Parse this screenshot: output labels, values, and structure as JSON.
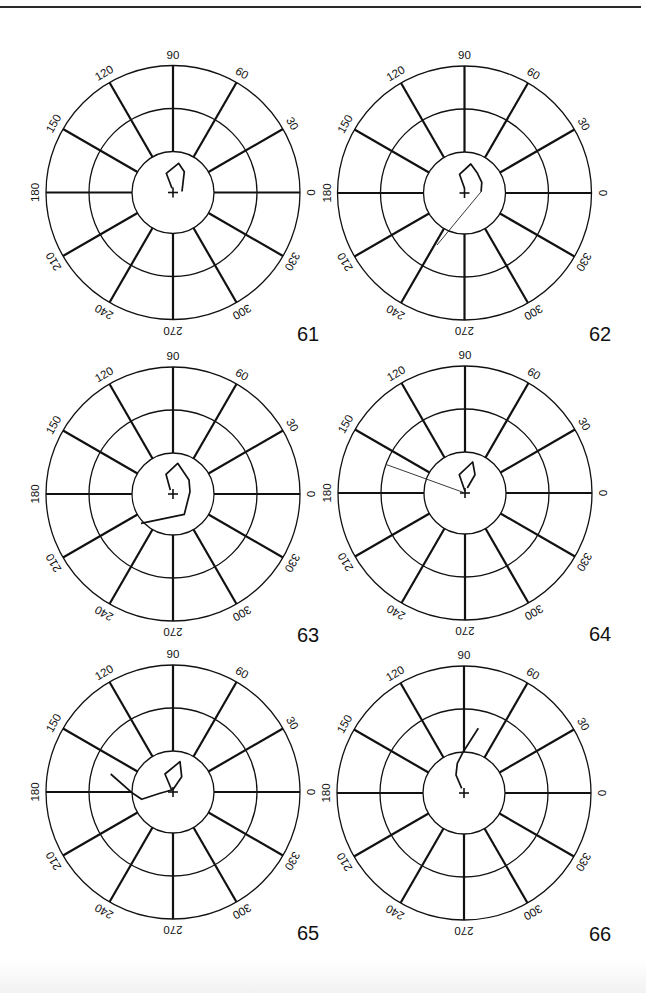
{
  "page": {
    "figure_count": 6,
    "plot_numbers": [
      "61",
      "62",
      "63",
      "64",
      "65",
      "66"
    ]
  },
  "chart_data": [
    {
      "type": "polar-hodograph",
      "id": "61",
      "label": "61",
      "angle_ticks": [
        0,
        30,
        60,
        90,
        120,
        150,
        180,
        210,
        240,
        270,
        300,
        330
      ],
      "rings": 3,
      "center": [
        173,
        192.5
      ],
      "trace_bold": [
        [
          9,
          -1
        ],
        [
          11.3,
          -20.8
        ],
        [
          5.6,
          -29.2
        ],
        [
          -6.7,
          -19.2
        ],
        [
          -1,
          -4.2
        ]
      ],
      "trace_thin": []
    },
    {
      "type": "polar-hodograph",
      "id": "62",
      "label": "62",
      "angle_ticks": [
        0,
        30,
        60,
        90,
        120,
        150,
        180,
        210,
        240,
        270,
        300,
        330
      ],
      "rings": 3,
      "center": [
        464.5,
        193
      ],
      "trace_bold": [
        [
          0,
          -4.7
        ],
        [
          -5,
          -18.7
        ],
        [
          6.3,
          -29
        ],
        [
          13,
          -19.7
        ],
        [
          17.3,
          -10.7
        ],
        [
          16.6,
          -1.3
        ]
      ],
      "trace_thin": [
        [
          16.6,
          -1.3
        ],
        [
          -27.5,
          52
        ]
      ]
    },
    {
      "type": "polar-hodograph",
      "id": "63",
      "label": "63",
      "angle_ticks": [
        0,
        30,
        60,
        90,
        120,
        150,
        180,
        210,
        240,
        270,
        300,
        330
      ],
      "rings": 3,
      "center": [
        173,
        494
      ],
      "trace_bold": [
        [
          -2.7,
          -4
        ],
        [
          -7,
          -19.7
        ],
        [
          4.7,
          -30.7
        ],
        [
          16,
          -14
        ],
        [
          17,
          -2.3
        ],
        [
          11.3,
          20.3
        ],
        [
          -32,
          29.3
        ]
      ],
      "trace_thin": []
    },
    {
      "type": "polar-hodograph",
      "id": "64",
      "label": "64",
      "angle_ticks": [
        0,
        30,
        60,
        90,
        120,
        150,
        180,
        210,
        240,
        270,
        300,
        330
      ],
      "rings": 3,
      "center": [
        465,
        493
      ],
      "trace_bold": [
        [
          0,
          -1.7
        ],
        [
          -5.7,
          -18.3
        ],
        [
          7.7,
          -31
        ],
        [
          10,
          -18.3
        ],
        [
          2.3,
          -5
        ]
      ],
      "trace_thin": [
        [
          0,
          0
        ],
        [
          -78.3,
          -28.3
        ]
      ]
    },
    {
      "type": "polar-hodograph",
      "id": "65",
      "label": "65",
      "angle_ticks": [
        0,
        30,
        60,
        90,
        120,
        150,
        180,
        210,
        240,
        270,
        300,
        330
      ],
      "rings": 3,
      "center": [
        173,
        792
      ],
      "trace_bold": [
        [
          -0.3,
          -2
        ],
        [
          8.7,
          -15.3
        ],
        [
          7,
          -30.3
        ],
        [
          -8,
          -18
        ],
        [
          -1.3,
          -2
        ],
        [
          -13,
          1.3
        ],
        [
          -31.3,
          7.3
        ],
        [
          -40.3,
          1.3
        ],
        [
          -62.3,
          -18
        ]
      ],
      "trace_thin": []
    },
    {
      "type": "polar-hodograph",
      "id": "66",
      "label": "66",
      "angle_ticks": [
        0,
        30,
        60,
        90,
        120,
        150,
        180,
        210,
        240,
        270,
        300,
        330
      ],
      "rings": 3,
      "center": [
        464,
        793
      ],
      "trace_bold": [
        [
          -2.3,
          -4.7
        ],
        [
          -8,
          -18
        ],
        [
          -6.7,
          -29.7
        ],
        [
          -0.7,
          -41.3
        ],
        [
          14.3,
          -64.7
        ]
      ],
      "trace_thin": []
    }
  ]
}
